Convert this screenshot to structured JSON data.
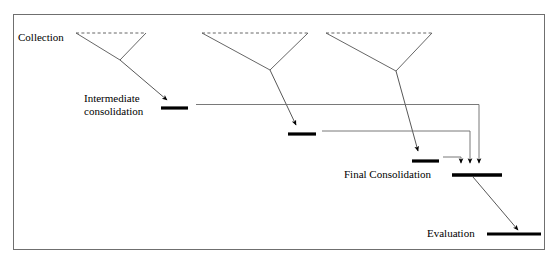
{
  "figure": {
    "kind": "process-diagram",
    "title_visible": false,
    "background_color": "#ffffff",
    "border": {
      "name": "figure-border",
      "x": 13,
      "y": 14,
      "width": 532,
      "height": 236,
      "color": "#666666",
      "stroke_width": 1
    },
    "colors": {
      "line": "#555555",
      "thick_bar": "#000000",
      "arrow": "#000000",
      "text": "#000000",
      "border": "#666666"
    }
  },
  "labels": [
    {
      "id": "collection",
      "text": "Collection",
      "x": 18,
      "y": 41,
      "anchor": "start",
      "font_size": 11
    },
    {
      "id": "intermediate-consolidation-line1",
      "text": "Intermediate",
      "x": 84,
      "y": 102,
      "anchor": "start",
      "font_size": 11
    },
    {
      "id": "intermediate-consolidation-line2",
      "text": "consolidation",
      "x": 84,
      "y": 115,
      "anchor": "start",
      "font_size": 11
    },
    {
      "id": "final-consolidation",
      "text": "Final Consolidation",
      "x": 344,
      "y": 178,
      "anchor": "start",
      "font_size": 11
    },
    {
      "id": "evaluation",
      "text": "Evaluation",
      "x": 427,
      "y": 237,
      "anchor": "start",
      "font_size": 11
    }
  ],
  "collection_trees": [
    {
      "id": "tree-1",
      "dashed_top": {
        "x1": 76,
        "y1": 33,
        "x2": 146,
        "y2": 33
      },
      "left_leg": {
        "x1": 76,
        "y1": 33,
        "x2": 120,
        "y2": 60
      },
      "right_leg": {
        "x1": 146,
        "y1": 33,
        "x2": 120,
        "y2": 60
      },
      "stem_arrow": {
        "x1": 120,
        "y1": 60,
        "x2": 168,
        "y2": 99
      }
    },
    {
      "id": "tree-2",
      "dashed_top": {
        "x1": 202,
        "y1": 33,
        "x2": 308,
        "y2": 33
      },
      "left_leg": {
        "x1": 202,
        "y1": 33,
        "x2": 270,
        "y2": 70
      },
      "right_leg": {
        "x1": 308,
        "y1": 33,
        "x2": 270,
        "y2": 70
      },
      "stem_arrow": {
        "x1": 270,
        "y1": 70,
        "x2": 297,
        "y2": 124
      }
    },
    {
      "id": "tree-3",
      "dashed_top": {
        "x1": 326,
        "y1": 33,
        "x2": 432,
        "y2": 33
      },
      "left_leg": {
        "x1": 326,
        "y1": 33,
        "x2": 396,
        "y2": 71
      },
      "right_leg": {
        "x1": 432,
        "y1": 33,
        "x2": 396,
        "y2": 71
      },
      "stem_arrow": {
        "x1": 396,
        "y1": 71,
        "x2": 419,
        "y2": 150
      }
    }
  ],
  "bars": [
    {
      "id": "intermediate-bar-1",
      "name": "intermediate-consolidation-bar-1",
      "x1": 161,
      "x2": 188,
      "y": 108,
      "thickness": 3.2
    },
    {
      "id": "intermediate-bar-2",
      "name": "intermediate-consolidation-bar-2",
      "x1": 288,
      "x2": 316,
      "y": 134,
      "thickness": 3.2
    },
    {
      "id": "intermediate-bar-3",
      "name": "intermediate-consolidation-bar-3",
      "x1": 412,
      "x2": 439,
      "y": 161,
      "thickness": 3.2
    },
    {
      "id": "final-consolidation-bar",
      "name": "final-consolidation-bar",
      "x1": 452,
      "x2": 502,
      "y": 175,
      "thickness": 3.6
    },
    {
      "id": "evaluation-bar",
      "name": "evaluation-bar",
      "x1": 487,
      "x2": 541,
      "y": 234,
      "thickness": 3.2
    }
  ],
  "connectors": [
    {
      "id": "connector-1",
      "name": "connector-bar1-to-final",
      "from_bar": "intermediate-bar-1",
      "path": "M 199 110 L 479 110 L 479 164",
      "arrow_at": {
        "x": 479,
        "y": 166
      }
    },
    {
      "id": "connector-2",
      "name": "connector-bar2-to-final",
      "from_bar": "intermediate-bar-2",
      "path": "M 322 137 L 470 137 L 470 164",
      "arrow_at": {
        "x": 470,
        "y": 166
      }
    },
    {
      "id": "connector-3",
      "name": "connector-bar3-to-final",
      "from_bar": "intermediate-bar-3",
      "path": "M 444 164 L 461 164 L 461 164",
      "arrow_at": {
        "x": 461,
        "y": 166
      }
    }
  ],
  "final_to_evaluation_arrow": {
    "id": "final-to-evaluation",
    "name": "final-consolidation-to-evaluation-arrow",
    "x1": 473,
    "y1": 177,
    "x2": 519,
    "y2": 229
  }
}
